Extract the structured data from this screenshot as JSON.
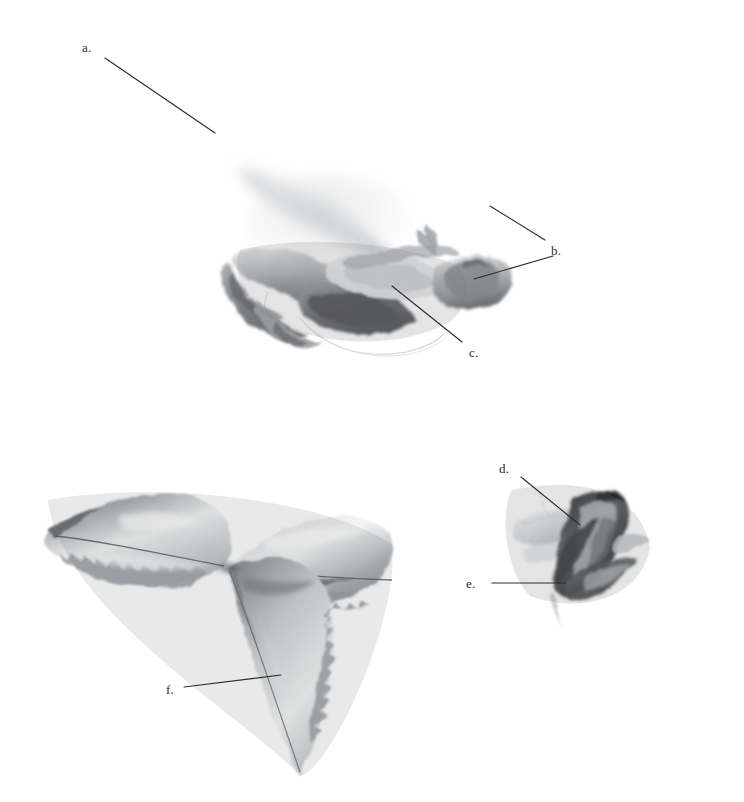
{
  "plate": {
    "title": "Botanical specimen plate — rose (monochrome watercolour)",
    "background_color": "#ffffff",
    "ink_color": "#2c2c2c",
    "width": 744,
    "height": 802
  },
  "specimens": [
    {
      "id": "specimen-flower-profile",
      "name": "flower-profile",
      "description": "Pale grey watercolour wash of an opened rose flower seen in profile, upper centre of the plate"
    },
    {
      "id": "specimen-trifoliate-leaf",
      "name": "trifoliate-leaf",
      "description": "Three serrated rose leaflets radiating from a common point, lower left of the plate"
    },
    {
      "id": "specimen-rose-bud",
      "name": "rose-bud",
      "description": "Dark-washed rose bud with sepals, lower right of the plate"
    }
  ],
  "labels": [
    {
      "key": "a",
      "text": "a.",
      "x": 82,
      "y": 40,
      "target": "flower-profile-upper-petal"
    },
    {
      "key": "b",
      "text": "b.",
      "x": 551,
      "y": 243,
      "target": "flower-profile-right-petal"
    },
    {
      "key": "c",
      "text": "c.",
      "x": 469,
      "y": 345,
      "target": "flower-profile-centre"
    },
    {
      "key": "d",
      "text": "d.",
      "x": 499,
      "y": 461,
      "target": "rose-bud-petal"
    },
    {
      "key": "e",
      "text": "e.",
      "x": 466,
      "y": 576,
      "target": "rose-bud-sepal"
    },
    {
      "key": "f",
      "text": "f.",
      "x": 166,
      "y": 682,
      "target": "leaf-lower-leaflet"
    }
  ],
  "leader_lines": [
    {
      "key": "a",
      "x1": 105,
      "y1": 58,
      "x2": 215,
      "y2": 133
    },
    {
      "key": "b-upper",
      "x1": 490,
      "y1": 206,
      "x2": 545,
      "y2": 240
    },
    {
      "key": "b-lower",
      "x1": 553,
      "y1": 256,
      "x2": 474,
      "y2": 279
    },
    {
      "key": "c",
      "x1": 462,
      "y1": 342,
      "x2": 392,
      "y2": 286
    },
    {
      "key": "d",
      "x1": 521,
      "y1": 477,
      "x2": 580,
      "y2": 525
    },
    {
      "key": "e",
      "x1": 492,
      "y1": 583,
      "x2": 566,
      "y2": 583
    },
    {
      "key": "f",
      "x1": 184,
      "y1": 687,
      "x2": 281,
      "y2": 675
    }
  ]
}
